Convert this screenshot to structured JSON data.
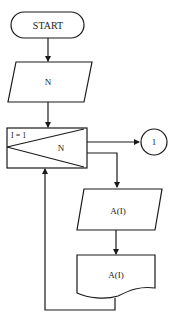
{
  "diagram": {
    "type": "flowchart",
    "colors": {
      "stroke": "#1a1a1a",
      "background": "#ffffff",
      "text": "#222222"
    },
    "nodes": {
      "start": {
        "shape": "terminal",
        "label": "START"
      },
      "input_n": {
        "shape": "parallelogram",
        "label": "N"
      },
      "loop": {
        "shape": "loop-box",
        "init_label": "I = 1",
        "limit_label": "N"
      },
      "connector": {
        "shape": "circle",
        "label": "1"
      },
      "input_a": {
        "shape": "parallelogram",
        "label": "A(I)"
      },
      "output_a": {
        "shape": "document",
        "label": "A(I)"
      }
    },
    "edges": [
      {
        "from": "start",
        "to": "input_n"
      },
      {
        "from": "input_n",
        "to": "loop"
      },
      {
        "from": "loop",
        "to": "connector",
        "note": "loop exit"
      },
      {
        "from": "loop",
        "to": "input_a",
        "note": "loop body"
      },
      {
        "from": "input_a",
        "to": "output_a"
      },
      {
        "from": "output_a",
        "to": "loop",
        "note": "return to loop"
      }
    ]
  }
}
